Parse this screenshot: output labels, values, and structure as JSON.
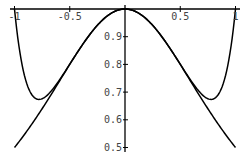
{
  "chart_data": {
    "type": "line",
    "title": "",
    "xlabel": "",
    "ylabel": "",
    "xlim": [
      -1,
      1
    ],
    "ylim": [
      0.5,
      1.0
    ],
    "grid": false,
    "legend": null,
    "x_ticks": [
      {
        "value": -1,
        "label": "-1"
      },
      {
        "value": -0.5,
        "label": "-0.5"
      },
      {
        "value": 0.5,
        "label": "0.5"
      },
      {
        "value": 1,
        "label": "1"
      }
    ],
    "y_ticks": [
      {
        "value": 0.9,
        "label": "0.9"
      },
      {
        "value": 0.8,
        "label": "0.8"
      },
      {
        "value": 0.7,
        "label": "0.7"
      },
      {
        "value": 0.6,
        "label": "0.6"
      },
      {
        "value": 0.5,
        "label": "0.5"
      }
    ],
    "series": [
      {
        "name": "f(x) = 1/(1+x^2)",
        "x": [
          -1,
          -0.9,
          -0.8,
          -0.7,
          -0.6,
          -0.5,
          -0.4,
          -0.3,
          -0.2,
          -0.1,
          0,
          0.1,
          0.2,
          0.3,
          0.4,
          0.5,
          0.6,
          0.7,
          0.8,
          0.9,
          1
        ],
        "values": [
          0.5,
          0.552,
          0.61,
          0.671,
          0.735,
          0.8,
          0.862,
          0.917,
          0.962,
          0.99,
          1.0,
          0.99,
          0.962,
          0.917,
          0.862,
          0.8,
          0.735,
          0.671,
          0.61,
          0.552,
          0.5
        ]
      },
      {
        "name": "Taylor polynomial 1 - x^2 + x^4 - x^6 + x^8",
        "x": [
          -1,
          -0.95,
          -0.9,
          -0.85,
          -0.8,
          -0.75,
          -0.7,
          -0.6,
          -0.5,
          -0.4,
          -0.3,
          -0.2,
          -0.1,
          0,
          0.1,
          0.2,
          0.3,
          0.4,
          0.5,
          0.6,
          0.7,
          0.75,
          0.8,
          0.85,
          0.9,
          0.95,
          1
        ],
        "values": [
          1.0,
          0.811,
          0.72,
          0.695,
          0.675,
          0.676,
          0.689,
          0.743,
          0.801,
          0.862,
          0.917,
          0.962,
          0.99,
          1.0,
          0.99,
          0.962,
          0.917,
          0.862,
          0.801,
          0.743,
          0.689,
          0.676,
          0.675,
          0.695,
          0.72,
          0.811,
          1.0
        ]
      }
    ],
    "colors": {
      "curve": "#000000",
      "axis": "#000000",
      "tick_label": "#444444"
    }
  }
}
